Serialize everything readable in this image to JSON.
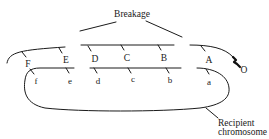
{
  "diagram": {
    "title_label": "Breakage",
    "donor_genes": [
      "F",
      "E",
      "D",
      "C",
      "B",
      "A"
    ],
    "origin_label": "O",
    "recipient_genes": [
      "f",
      "e",
      "d",
      "c",
      "b",
      "a"
    ],
    "recipient_label_line1": "Recipient",
    "recipient_label_line2": "chromosome",
    "colors": {
      "stroke": "#1a1a1a",
      "background": "#ffffff"
    }
  }
}
